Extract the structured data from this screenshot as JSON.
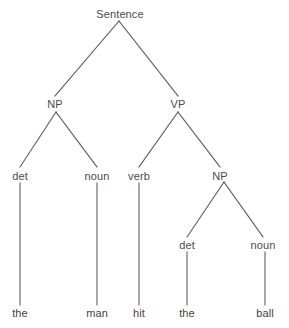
{
  "figure": {
    "kind": "constituency-syntax-tree",
    "sentence_text": "the man hit the ball",
    "width": 289,
    "height": 328,
    "background_color": "#ffffff",
    "line_color": "#595959",
    "label_color": "#4a4a4a",
    "leaf_color": "#3f3f3f"
  },
  "nodes": {
    "root": {
      "label": "Sentence",
      "x": 120,
      "y": 14
    },
    "np_subject": {
      "label": "NP",
      "x": 55,
      "y": 104
    },
    "vp": {
      "label": "VP",
      "x": 178,
      "y": 104
    },
    "det_1": {
      "label": "det",
      "x": 20,
      "y": 176
    },
    "noun_1": {
      "label": "noun",
      "x": 97,
      "y": 176
    },
    "verb": {
      "label": "verb",
      "x": 139,
      "y": 176
    },
    "np_object": {
      "label": "NP",
      "x": 220,
      "y": 176
    },
    "det_2": {
      "label": "det",
      "x": 187,
      "y": 245
    },
    "noun_2": {
      "label": "noun",
      "x": 263,
      "y": 245
    },
    "leaf_the_1": {
      "label": "the",
      "x": 20,
      "y": 313
    },
    "leaf_man": {
      "label": "man",
      "x": 97,
      "y": 313
    },
    "leaf_hit": {
      "label": "hit",
      "x": 139,
      "y": 313
    },
    "leaf_the_2": {
      "label": "the",
      "x": 187,
      "y": 313
    },
    "leaf_ball": {
      "label": "ball",
      "x": 265,
      "y": 313
    }
  },
  "edges": [
    {
      "name": "edge-sentence-to-np",
      "x1": 119,
      "y1": 21,
      "x2": 55,
      "y2": 96
    },
    {
      "name": "edge-sentence-to-vp",
      "x1": 119,
      "y1": 21,
      "x2": 178,
      "y2": 96
    },
    {
      "name": "edge-np-to-det",
      "x1": 56,
      "y1": 112,
      "x2": 20,
      "y2": 167
    },
    {
      "name": "edge-np-to-noun",
      "x1": 56,
      "y1": 112,
      "x2": 97,
      "y2": 167
    },
    {
      "name": "edge-vp-to-verb",
      "x1": 178,
      "y1": 112,
      "x2": 139,
      "y2": 167
    },
    {
      "name": "edge-vp-to-np",
      "x1": 178,
      "y1": 112,
      "x2": 220,
      "y2": 167
    },
    {
      "name": "edge-np2-to-det",
      "x1": 224,
      "y1": 182,
      "x2": 187,
      "y2": 237
    },
    {
      "name": "edge-np2-to-noun",
      "x1": 224,
      "y1": 182,
      "x2": 263,
      "y2": 237
    },
    {
      "name": "edge-det-to-the",
      "x1": 20,
      "y1": 183,
      "x2": 20,
      "y2": 305
    },
    {
      "name": "edge-noun-to-man",
      "x1": 97,
      "y1": 183,
      "x2": 97,
      "y2": 305
    },
    {
      "name": "edge-verb-to-hit",
      "x1": 139,
      "y1": 183,
      "x2": 139,
      "y2": 305
    },
    {
      "name": "edge-det2-to-the",
      "x1": 187,
      "y1": 252,
      "x2": 187,
      "y2": 305
    },
    {
      "name": "edge-noun2-to-ball",
      "x1": 265,
      "y1": 252,
      "x2": 265,
      "y2": 305
    }
  ]
}
